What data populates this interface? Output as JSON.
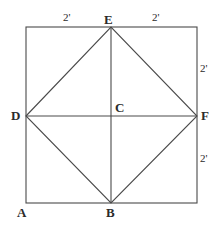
{
  "figure": {
    "stroke_color": "#4a4a4a",
    "label_color": "#2b2b2b",
    "background_color": "#ffffff",
    "square": {
      "left": 26,
      "top": 27,
      "right": 197,
      "bottom": 203
    },
    "vertices": [
      {
        "id": "E",
        "label": "E",
        "x": 111,
        "y": 27,
        "role": "top-edge-midpoint"
      },
      {
        "id": "D",
        "label": "D",
        "x": 26,
        "y": 116,
        "role": "left-edge-midpoint"
      },
      {
        "id": "F",
        "label": "F",
        "x": 197,
        "y": 116,
        "role": "right-edge-midpoint"
      },
      {
        "id": "B",
        "label": "B",
        "x": 111,
        "y": 203,
        "role": "bottom-edge-midpoint"
      },
      {
        "id": "C",
        "label": "C",
        "x": 111,
        "y": 116,
        "role": "center"
      },
      {
        "id": "A",
        "label": "A",
        "x": 26,
        "y": 203,
        "role": "bottom-left-corner"
      }
    ],
    "measurements": [
      {
        "id": "top-left",
        "label": "2'",
        "segment": "A-side top half left of E",
        "value": 2,
        "unit": "ft"
      },
      {
        "id": "top-right",
        "label": "2'",
        "segment": "top side right of E",
        "value": 2,
        "unit": "ft"
      },
      {
        "id": "right-up",
        "label": "2'",
        "segment": "right side above F",
        "value": 2,
        "unit": "ft"
      },
      {
        "id": "right-low",
        "label": "2'",
        "segment": "right side below F",
        "value": 2,
        "unit": "ft"
      }
    ],
    "segments": [
      {
        "id": "square-top",
        "from": "top-left-corner",
        "to": "top-right-corner"
      },
      {
        "id": "square-right",
        "from": "top-right-corner",
        "to": "bottom-right-corner"
      },
      {
        "id": "square-bottom",
        "from": "bottom-right-corner",
        "to": "bottom-left-corner"
      },
      {
        "id": "square-left",
        "from": "bottom-left-corner",
        "to": "top-left-corner"
      },
      {
        "id": "rhombus-DE",
        "from": "D",
        "to": "E"
      },
      {
        "id": "rhombus-EF",
        "from": "E",
        "to": "F"
      },
      {
        "id": "rhombus-FB",
        "from": "F",
        "to": "B"
      },
      {
        "id": "rhombus-BD",
        "from": "B",
        "to": "D"
      },
      {
        "id": "diagonal-DF",
        "from": "D",
        "to": "F"
      },
      {
        "id": "diagonal-EB",
        "from": "E",
        "to": "B"
      }
    ]
  }
}
